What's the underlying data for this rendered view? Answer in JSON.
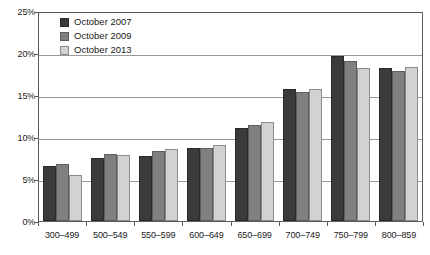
{
  "chart_data": {
    "type": "bar",
    "title": "",
    "xlabel": "",
    "ylabel": "",
    "ylim": [
      0,
      25
    ],
    "ytick_labels": [
      "0%",
      "5%",
      "10%",
      "15%",
      "20%",
      "25%"
    ],
    "ytick_values": [
      0,
      5,
      10,
      15,
      20,
      25
    ],
    "grid": true,
    "legend_position": "top-left",
    "categories": [
      "300–499",
      "500–549",
      "550–599",
      "600–649",
      "650–699",
      "700–749",
      "750–799",
      "800–859"
    ],
    "series": [
      {
        "name": "October 2007",
        "color": "#3a3a3a",
        "values": [
          6.6,
          7.5,
          7.7,
          8.7,
          11.1,
          15.7,
          19.6,
          18.2
        ]
      },
      {
        "name": "October 2009",
        "color": "#808080",
        "values": [
          6.8,
          8.0,
          8.3,
          8.7,
          11.4,
          15.4,
          19.1,
          17.8
        ]
      },
      {
        "name": "October 2013",
        "color": "#d2d2d2",
        "values": [
          5.5,
          7.8,
          8.6,
          9.1,
          11.8,
          15.7,
          18.2,
          18.3
        ]
      }
    ]
  },
  "axis": {
    "y_labels": [
      "25%",
      "20%",
      "15%",
      "10%",
      "5%",
      "0%"
    ]
  },
  "legend": {
    "items": [
      {
        "label": "October 2007"
      },
      {
        "label": "October 2009"
      },
      {
        "label": "October 2013"
      }
    ]
  }
}
